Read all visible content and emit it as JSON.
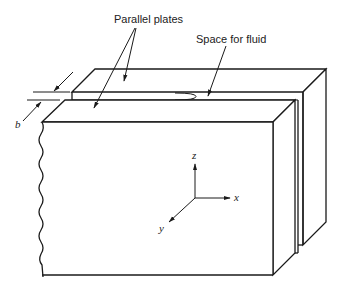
{
  "figure": {
    "type": "Parallel-plate geometry (schematic)",
    "labels": {
      "parallel_plates": "Parallel plates",
      "space_for_fluid": "Space for fluid",
      "gap": "b"
    },
    "axes": {
      "x": "x",
      "y": "y",
      "z": "z"
    },
    "colors": {
      "line": "#1a1a1a",
      "background": "#ffffff"
    }
  }
}
